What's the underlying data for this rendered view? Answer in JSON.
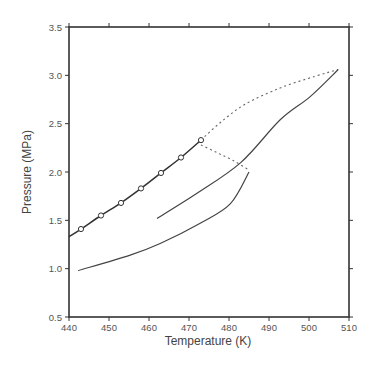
{
  "chart_data": {
    "type": "line",
    "title": "",
    "xlabel": "Temperature (K)",
    "ylabel": "Pressure (MPa)",
    "xlim": [
      440,
      510
    ],
    "ylim": [
      0.5,
      3.5
    ],
    "xticks": [
      440,
      450,
      460,
      470,
      480,
      490,
      500,
      510
    ],
    "yticks": [
      0.5,
      1.0,
      1.5,
      2.0,
      2.5,
      3.0,
      3.5
    ],
    "xtick_labels": [
      "440",
      "450",
      "460",
      "470",
      "480",
      "490",
      "500",
      "510"
    ],
    "ytick_labels": [
      "0.5",
      "1.0",
      "1.5",
      "2.0",
      "2.5",
      "3.0",
      "3.5"
    ],
    "grid": false,
    "legend": null,
    "series": [
      {
        "name": "vapor-pressure-curve",
        "style": "solid-with-markers",
        "marker": "open-circle",
        "x": [
          440.0,
          443.0,
          448.0,
          453.0,
          458.0,
          463.0,
          468.0,
          473.0
        ],
        "y": [
          1.33,
          1.41,
          1.55,
          1.68,
          1.83,
          1.99,
          2.15,
          2.33
        ],
        "markers_at": [
          443.0,
          448.0,
          453.0,
          458.0,
          463.0,
          468.0,
          473.0
        ]
      },
      {
        "name": "upper-dashed-curve",
        "style": "dotted",
        "x": [
          473.0,
          477.8,
          484.0,
          492.8,
          501.5,
          507.3
        ],
        "y": [
          2.33,
          2.51,
          2.7,
          2.87,
          2.99,
          3.06
        ]
      },
      {
        "name": "lower-dashed-curve",
        "style": "dotted",
        "x": [
          473.0,
          477.0,
          481.0,
          485.0
        ],
        "y": [
          2.28,
          2.2,
          2.12,
          2.02
        ]
      },
      {
        "name": "solid-curve-upper",
        "style": "solid",
        "x": [
          462.0,
          472.0,
          483.0,
          492.8,
          500.3,
          507.3
        ],
        "y": [
          1.52,
          1.78,
          2.1,
          2.54,
          2.78,
          3.06
        ]
      },
      {
        "name": "solid-curve-lower",
        "style": "solid",
        "x": [
          442.3,
          455.3,
          462.8,
          472.8,
          480.3,
          485.0
        ],
        "y": [
          0.98,
          1.14,
          1.26,
          1.47,
          1.67,
          2.0
        ]
      }
    ]
  }
}
